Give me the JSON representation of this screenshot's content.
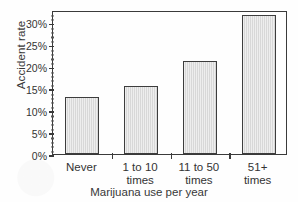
{
  "chart_data": {
    "type": "bar",
    "title": "",
    "xlabel": "Marijuana use per year",
    "ylabel": "Accident rate",
    "categories": [
      "Never",
      "1 to 10 times",
      "11 to 50 times",
      "51+ times"
    ],
    "category_lines": [
      [
        "Never",
        ""
      ],
      [
        "1 to 10",
        "times"
      ],
      [
        "11 to 50",
        "times"
      ],
      [
        "51+",
        "times"
      ]
    ],
    "values": [
      13.0,
      15.5,
      21.2,
      31.7
    ],
    "value_labels": [
      "13%",
      "15.5%",
      "21.2%",
      "31.7%"
    ],
    "ylim": [
      0,
      32.8
    ],
    "ytick_labels": [
      "0%",
      "5%",
      "10%",
      "15%",
      "20%",
      "25%",
      "30%"
    ],
    "ytick_values": [
      0,
      5,
      10,
      15,
      20,
      25,
      30
    ],
    "yminor_step": 1,
    "grid": false,
    "legend": false,
    "bar_fill_color": "#dcdcdc",
    "bar_edge_color": "#3d3d3d",
    "axis_color": "#3a3a3a",
    "background_color": "#fefefe"
  }
}
